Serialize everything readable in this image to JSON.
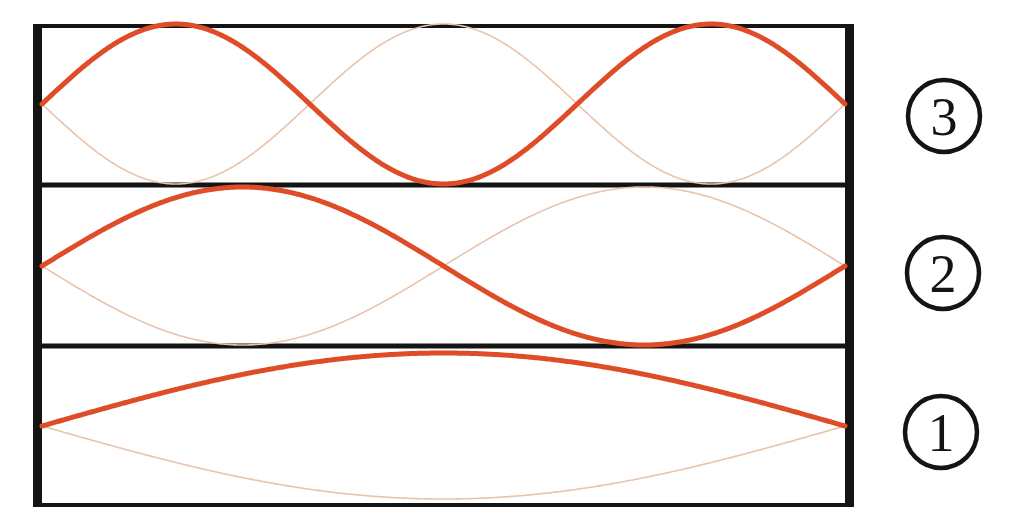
{
  "figure": {
    "background_color": "#ffffff",
    "frame": {
      "line_color": "#141414",
      "left": 33,
      "top": 24,
      "right": 854,
      "bottom": 507,
      "wall_thickness": 9,
      "top_bottom_thickness": 4
    },
    "dividers": [
      {
        "y": 185,
        "thickness": 5
      },
      {
        "y": 346,
        "thickness": 5
      }
    ],
    "panels": [
      {
        "id": "panel-3",
        "level": 3,
        "label": "3",
        "label_cx": 944,
        "label_cy": 116,
        "label_r": 36,
        "top": 26,
        "bottom": 183,
        "midline": 104,
        "amplitude": 80,
        "wave_primary_color": "#DE4C28",
        "wave_ghost_color": "#E9C3AB",
        "wave_primary_width": 5.0,
        "wave_ghost_width": 1.6
      },
      {
        "id": "panel-2",
        "level": 2,
        "label": "2",
        "label_cx": 943,
        "label_cy": 273,
        "label_r": 36,
        "top": 188,
        "bottom": 344,
        "midline": 266,
        "amplitude": 79,
        "wave_primary_color": "#DE4C28",
        "wave_ghost_color": "#E9C3AB",
        "wave_primary_width": 5.0,
        "wave_ghost_width": 1.6
      },
      {
        "id": "panel-1",
        "level": 1,
        "label": "1",
        "label_cx": 941,
        "label_cy": 432,
        "label_r": 36,
        "top": 349,
        "bottom": 505,
        "midline": 426,
        "amplitude": 73,
        "wave_primary_color": "#DE4C28",
        "wave_ghost_color": "#E9C3AB",
        "wave_primary_width": 5.0,
        "wave_ghost_width": 1.6
      }
    ],
    "colors": {
      "ink": "#141414",
      "wave_primary": "#DE4C28",
      "wave_ghost": "#E9C3AB",
      "paper": "#ffffff"
    }
  },
  "chart_data": {
    "type": "line",
    "xlabel": "",
    "ylabel": "",
    "grid": false,
    "legend": "none",
    "xlim": [
      0,
      1
    ],
    "ylim": [
      -1,
      1
    ],
    "annotations": [
      "3",
      "2",
      "1"
    ],
    "series": [
      {
        "name": "n = 3 (bold)",
        "panel": "panel-3",
        "mode_number": 3,
        "half_wavelengths": 3,
        "phase": "positive",
        "formula": "y = A*sin(3*pi*x/L)",
        "x": [
          0,
          0.0833,
          0.1667,
          0.25,
          0.3333,
          0.4167,
          0.5,
          0.5833,
          0.6667,
          0.75,
          0.8333,
          0.9167,
          1
        ],
        "values": [
          0,
          0.707,
          1,
          0.707,
          0,
          -0.707,
          -1,
          -0.707,
          0,
          0.707,
          1,
          0.707,
          0
        ],
        "nodes_x": [
          0,
          0.3333,
          0.6667,
          1
        ],
        "antinodes_x": [
          0.1667,
          0.5,
          0.8333
        ]
      },
      {
        "name": "n = 3 (faint, inverted)",
        "panel": "panel-3",
        "mode_number": 3,
        "half_wavelengths": 3,
        "phase": "negative",
        "formula": "y = -A*sin(3*pi*x/L)",
        "x": [
          0,
          0.0833,
          0.1667,
          0.25,
          0.3333,
          0.4167,
          0.5,
          0.5833,
          0.6667,
          0.75,
          0.8333,
          0.9167,
          1
        ],
        "values": [
          0,
          -0.707,
          -1,
          -0.707,
          0,
          0.707,
          1,
          0.707,
          0,
          -0.707,
          -1,
          -0.707,
          0
        ]
      },
      {
        "name": "n = 2 (bold)",
        "panel": "panel-2",
        "mode_number": 2,
        "half_wavelengths": 2,
        "phase": "positive",
        "formula": "y = A*sin(2*pi*x/L)",
        "x": [
          0,
          0.125,
          0.25,
          0.375,
          0.5,
          0.625,
          0.75,
          0.875,
          1
        ],
        "values": [
          0,
          0.707,
          1,
          0.707,
          0,
          -0.707,
          -1,
          -0.707,
          0
        ],
        "nodes_x": [
          0,
          0.5,
          1
        ],
        "antinodes_x": [
          0.25,
          0.75
        ]
      },
      {
        "name": "n = 2 (faint, inverted)",
        "panel": "panel-2",
        "mode_number": 2,
        "half_wavelengths": 2,
        "phase": "negative",
        "formula": "y = -A*sin(2*pi*x/L)",
        "x": [
          0,
          0.125,
          0.25,
          0.375,
          0.5,
          0.625,
          0.75,
          0.875,
          1
        ],
        "values": [
          0,
          -0.707,
          -1,
          -0.707,
          0,
          0.707,
          1,
          0.707,
          0
        ]
      },
      {
        "name": "n = 1 (bold)",
        "panel": "panel-1",
        "mode_number": 1,
        "half_wavelengths": 1,
        "phase": "positive",
        "formula": "y = A*sin(pi*x/L)",
        "x": [
          0,
          0.125,
          0.25,
          0.375,
          0.5,
          0.625,
          0.75,
          0.875,
          1
        ],
        "values": [
          0,
          0.383,
          0.707,
          0.924,
          1,
          0.924,
          0.707,
          0.383,
          0
        ],
        "nodes_x": [
          0,
          1
        ],
        "antinodes_x": [
          0.5
        ]
      },
      {
        "name": "n = 1 (faint, inverted)",
        "panel": "panel-1",
        "mode_number": 1,
        "half_wavelengths": 1,
        "phase": "negative",
        "formula": "y = -A*sin(pi*x/L)",
        "x": [
          0,
          0.125,
          0.25,
          0.375,
          0.5,
          0.625,
          0.75,
          0.875,
          1
        ],
        "values": [
          0,
          -0.383,
          -0.707,
          -0.924,
          -1,
          -0.924,
          -0.707,
          -0.383,
          0
        ]
      }
    ]
  }
}
